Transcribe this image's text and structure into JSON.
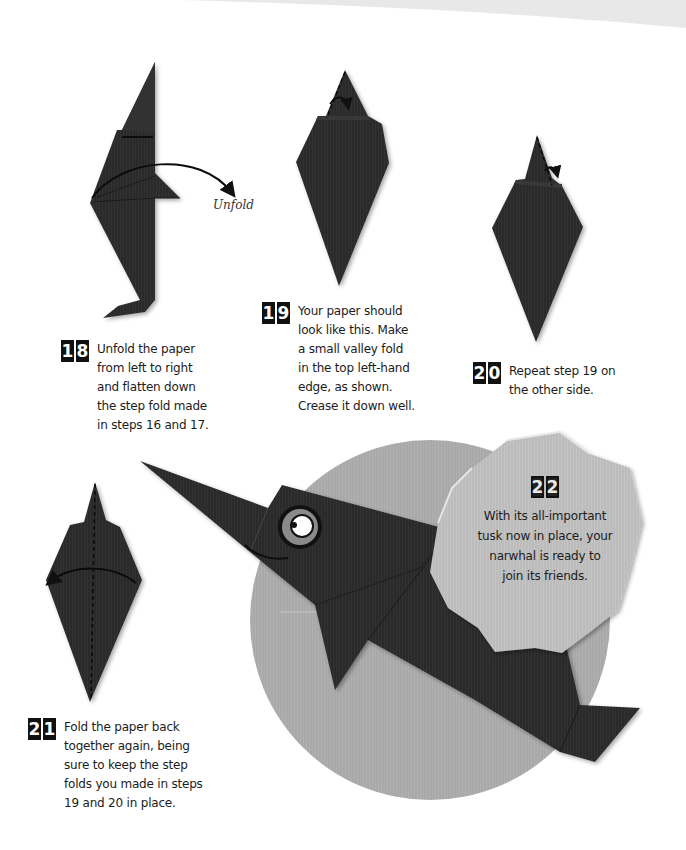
{
  "page": {
    "background": "#ffffff",
    "paper_color": "#2b2b2b",
    "circle_color": "#a6a6a6",
    "badge_color": "#bdbdbd"
  },
  "annotations": {
    "unfold_label": "Unfold"
  },
  "steps": [
    {
      "number": "18",
      "digits": [
        "1",
        "8"
      ],
      "text_lines": [
        "Unfold the paper",
        "from left to right",
        "and flatten down",
        "the step fold made",
        "in steps 16 and 17."
      ]
    },
    {
      "number": "19",
      "digits": [
        "1",
        "9"
      ],
      "text_lines": [
        "Your paper should",
        "look like this. Make",
        "a small valley fold",
        "in the top left-hand",
        "edge, as shown.",
        "Crease it down well."
      ]
    },
    {
      "number": "20",
      "digits": [
        "2",
        "0"
      ],
      "text_lines": [
        "Repeat step 19 on",
        "the other side."
      ]
    },
    {
      "number": "21",
      "digits": [
        "2",
        "1"
      ],
      "text_lines": [
        "Fold the paper back",
        "together again, being",
        "sure to keep the step",
        "folds you made in steps",
        "19 and 20 in place."
      ]
    },
    {
      "number": "22",
      "digits": [
        "2",
        "2"
      ],
      "text_lines": [
        "With its all-important",
        "tusk now in place, your",
        "narwhal is ready to",
        "join its friends."
      ]
    }
  ]
}
